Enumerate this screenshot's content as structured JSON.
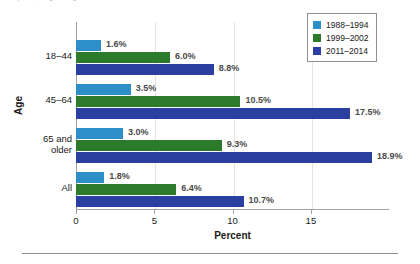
{
  "caption": {
    "text": "reported, among adults aged 18 and over: United States"
  },
  "legend": {
    "position": "top-right",
    "items": [
      {
        "label": "1988–1994",
        "color": "#2e8fc8"
      },
      {
        "label": "1999–2002",
        "color": "#2c7a2c"
      },
      {
        "label": "2011–2014",
        "color": "#2a3fa0"
      }
    ]
  },
  "axes": {
    "x_title": "Percent",
    "y_title": "Age",
    "x_ticks": [
      "0",
      "5",
      "10",
      "15"
    ]
  },
  "chart_data": {
    "type": "bar",
    "orientation": "horizontal",
    "title": "",
    "xlabel": "Percent",
    "ylabel": "Age",
    "xlim": [
      0,
      20
    ],
    "grid": true,
    "legend_position": "top-right",
    "categories": [
      "18–44",
      "45–64",
      "65 and older",
      "All"
    ],
    "series": [
      {
        "name": "1988–1994",
        "color": "#2e8fc8",
        "values": [
          1.6,
          3.5,
          3.0,
          1.8
        ],
        "labels": [
          "1.6%",
          "3.5%",
          "3.0%",
          "1.8%"
        ]
      },
      {
        "name": "1999–2002",
        "color": "#2c7a2c",
        "values": [
          6.0,
          10.5,
          9.3,
          6.4
        ],
        "labels": [
          "6.0%",
          "10.5%",
          "9.3%",
          "6.4%"
        ]
      },
      {
        "name": "2011–2014",
        "color": "#2a3fa0",
        "values": [
          8.8,
          17.5,
          18.9,
          10.7
        ],
        "labels": [
          "8.8%",
          "17.5%",
          "18.9%",
          "10.7%"
        ]
      }
    ]
  }
}
